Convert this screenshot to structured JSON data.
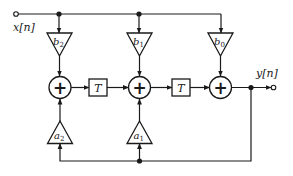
{
  "diagram": {
    "type": "signal-flow-graph",
    "input": {
      "label": "x[n]"
    },
    "output": {
      "label": "y[n]"
    },
    "feedforward_gains": [
      {
        "name": "b",
        "sub": "2"
      },
      {
        "name": "b",
        "sub": "1"
      },
      {
        "name": "b",
        "sub": "0"
      }
    ],
    "feedback_gains": [
      {
        "name": "a",
        "sub": "2"
      },
      {
        "name": "a",
        "sub": "1"
      }
    ],
    "delays": [
      {
        "label": "T"
      },
      {
        "label": "T"
      }
    ],
    "adders": [
      {
        "symbol": "+"
      },
      {
        "symbol": "+"
      },
      {
        "symbol": "+"
      }
    ],
    "colors": {
      "stroke": "#1a1a1a",
      "background": "#ffffff"
    }
  }
}
